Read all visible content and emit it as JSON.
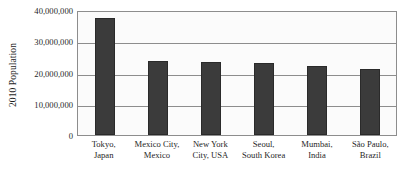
{
  "chart_data": {
    "type": "bar",
    "title": "",
    "subtitle": "",
    "xlabel": "",
    "ylabel": "2010 Population",
    "ylim": [
      0,
      40000000
    ],
    "grid": true,
    "legend": "none",
    "bar_color": "#3b3b3b",
    "plot_background": "#fbfbfb",
    "axis_color": "#8d8d8d",
    "categories": [
      "Tokyo, Japan",
      "Mexico City, Mexico",
      "New York City, USA",
      "Seoul, South Korea",
      "Mumbai, India",
      "São Paulo, Brazil"
    ],
    "category_lines": [
      {
        "line1": "Tokyo,",
        "line2": "Japan"
      },
      {
        "line1": "Mexico City,",
        "line2": "Mexico"
      },
      {
        "line1": "New York",
        "line2": "City, USA"
      },
      {
        "line1": "Seoul,",
        "line2": "South Korea"
      },
      {
        "line1": "Mumbai,",
        "line2": "India"
      },
      {
        "line1": "São Paulo,",
        "line2": "Brazil"
      }
    ],
    "values": [
      37500000,
      23700000,
      23400000,
      23000000,
      22100000,
      21000000
    ],
    "yticks": [
      0,
      10000000,
      20000000,
      30000000,
      40000000
    ],
    "ytick_labels": [
      "0",
      "10,000,000",
      "20,000,000",
      "30,000,000",
      "40,000,000"
    ]
  }
}
